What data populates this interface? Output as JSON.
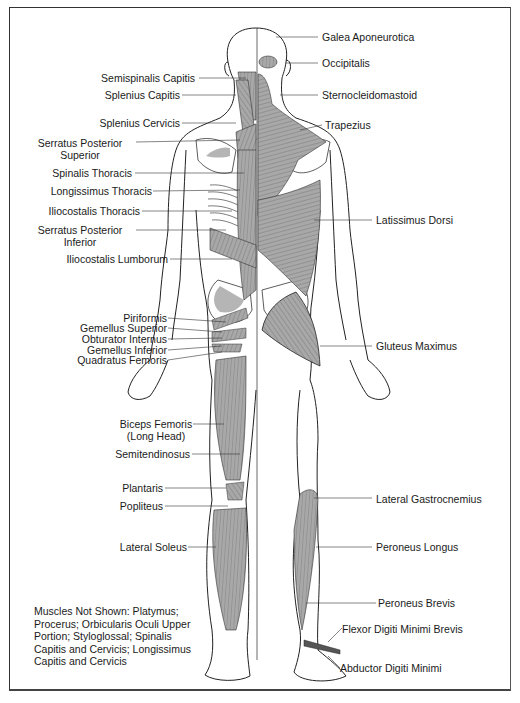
{
  "diagram": {
    "title": "",
    "view": "posterior view of human body muscles",
    "colors": {
      "border": "#333333",
      "outline": "#222222",
      "muscle_fill": "#a8a8a8",
      "bone_fill": "#ffffff",
      "accent_bone_shade": "#b5b5b5"
    },
    "labels_left": [
      {
        "id": "semispinalis-capitis",
        "text": "Semispinalis Capitis"
      },
      {
        "id": "splenius-capitis",
        "text": "Splenius Capitis"
      },
      {
        "id": "splenius-cervicis",
        "text": "Splenius Cervicis"
      },
      {
        "id": "serratus-posterior-superior",
        "line1": "Serratus Posterior",
        "line2": "Superior"
      },
      {
        "id": "spinalis-thoracis",
        "text": "Spinalis Thoracis"
      },
      {
        "id": "longissimus-thoracis",
        "text": "Longissimus Thoracis"
      },
      {
        "id": "iliocostalis-thoracis",
        "text": "Iliocostalis Thoracis"
      },
      {
        "id": "serratus-posterior-inferior",
        "line1": "Serratus Posterior",
        "line2": "Inferior"
      },
      {
        "id": "iliocostalis-lumborum",
        "text": "Iliocostalis Lumborum"
      },
      {
        "id": "piriformis",
        "text": "Piriformis"
      },
      {
        "id": "gemellus-superior",
        "text": "Gemellus Superior"
      },
      {
        "id": "obturator-internus",
        "text": "Obturator Internus"
      },
      {
        "id": "gemellus-inferior",
        "text": "Gemellus Inferior"
      },
      {
        "id": "quadratus-femoris",
        "text": "Quadratus Femoris"
      },
      {
        "id": "biceps-femoris",
        "line1": "Biceps Femoris",
        "line2": "(Long Head)"
      },
      {
        "id": "semitendinosus",
        "text": "Semitendinosus"
      },
      {
        "id": "plantaris",
        "text": "Plantaris"
      },
      {
        "id": "popliteus",
        "text": "Popliteus"
      },
      {
        "id": "lateral-soleus",
        "text": "Lateral Soleus"
      }
    ],
    "labels_right": [
      {
        "id": "galea-aponeurotica",
        "text": "Galea Aponeurotica"
      },
      {
        "id": "occipitalis",
        "text": "Occipitalis"
      },
      {
        "id": "sternocleidomastoid",
        "text": "Sternocleidomastoid"
      },
      {
        "id": "trapezius",
        "text": "Trapezius"
      },
      {
        "id": "latissimus-dorsi",
        "text": "Latissimus Dorsi"
      },
      {
        "id": "gluteus-maximus",
        "text": "Gluteus Maximus"
      },
      {
        "id": "lateral-gastrocnemius",
        "text": "Lateral Gastrocnemius"
      },
      {
        "id": "peroneus-longus",
        "text": "Peroneus Longus"
      },
      {
        "id": "peroneus-brevis",
        "text": "Peroneus Brevis"
      },
      {
        "id": "flexor-digiti-minimi-brevis",
        "text": "Flexor Digiti Minimi Brevis"
      },
      {
        "id": "abductor-digiti-minimi",
        "text": "Abductor Digiti Minimi"
      }
    ],
    "note": {
      "lines": [
        "Muscles Not Shown: Platymus;",
        "Procerus; Orbicularis Oculi Upper",
        "Portion; Styloglossal; Spinalis",
        "Capitis and Cervicis; Longissimus",
        "Capitis and Cervicis"
      ]
    }
  }
}
